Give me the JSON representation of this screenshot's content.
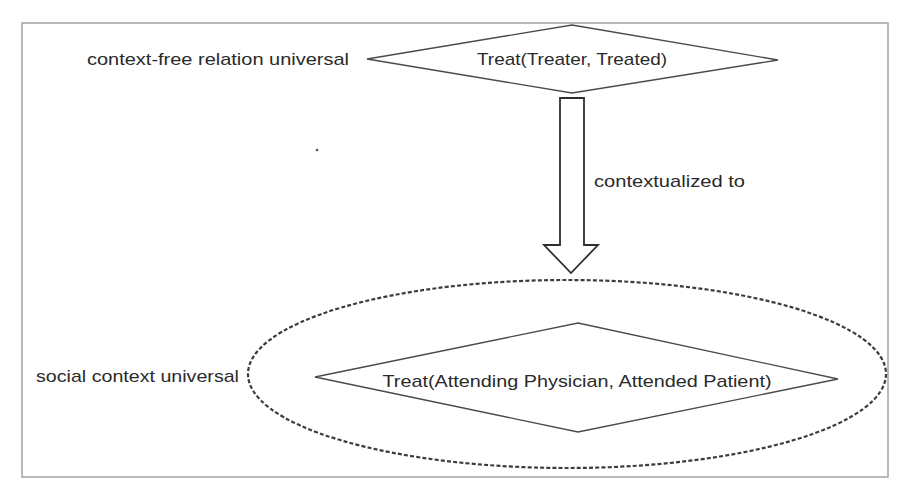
{
  "diagram": {
    "top_node": {
      "side_label": "context-free relation universal",
      "relation_text": "Treat(Treater, Treated)"
    },
    "arrow": {
      "label": "contextualized to"
    },
    "bottom_node": {
      "side_label": "social context universal",
      "relation_text": "Treat(Attending Physician, Attended Patient)"
    },
    "colors": {
      "frame": "#a9a9a9",
      "stroke": "#4a4a4a",
      "text": "#2a2a2a",
      "background": "#ffffff"
    }
  }
}
